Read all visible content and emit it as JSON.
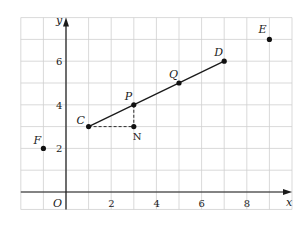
{
  "figure": {
    "x_axis_label": "x",
    "y_axis_label": "y",
    "origin_label": "O",
    "x_ticks": [
      {
        "value": 2,
        "label": "2"
      },
      {
        "value": 4,
        "label": "4"
      },
      {
        "value": 6,
        "label": "6"
      },
      {
        "value": 8,
        "label": "8"
      }
    ],
    "y_ticks": [
      {
        "value": 2,
        "label": "2"
      },
      {
        "value": 4,
        "label": "4"
      },
      {
        "value": 6,
        "label": "6"
      }
    ],
    "grid": {
      "x_min": -2,
      "x_max": 10,
      "y_min": -0.8,
      "y_max": 8,
      "step": 1
    },
    "points": [
      {
        "name": "C",
        "x": 1,
        "y": 3
      },
      {
        "name": "P",
        "x": 3,
        "y": 4
      },
      {
        "name": "Q",
        "x": 5,
        "y": 5
      },
      {
        "name": "D",
        "x": 7,
        "y": 6
      },
      {
        "name": "E",
        "x": 9,
        "y": 7
      },
      {
        "name": "F",
        "x": -1,
        "y": 2
      },
      {
        "name": "N",
        "x": 3,
        "y": 3
      }
    ],
    "segments": [
      {
        "from": "C",
        "to": "D",
        "style": "solid"
      },
      {
        "from": "C",
        "to": "N",
        "style": "dashed"
      },
      {
        "from": "P",
        "to": "N",
        "style": "dashed"
      }
    ],
    "colors": {
      "grid": "#cfcfcf",
      "axis": "#1a1a1a",
      "point": "#111111"
    }
  }
}
